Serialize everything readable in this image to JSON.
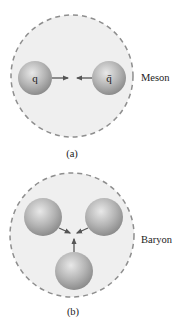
{
  "panel_a": {
    "caption": "(a)",
    "label": "Meson",
    "quark_left": "q",
    "quark_right": "q̄"
  },
  "panel_b": {
    "caption": "(b)",
    "label": "Baryon"
  },
  "colors": {
    "region_fill": "#efefef",
    "dash_stroke": "#8e8e8e",
    "sphere_light": "#e6e6e6",
    "sphere_dark": "#8c8c8c",
    "arrow": "#555555",
    "text": "#222222"
  }
}
